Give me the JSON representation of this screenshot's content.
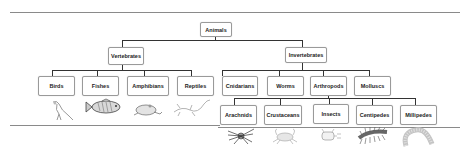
{
  "diagram": {
    "root": "Animals",
    "level1": {
      "vertebrates": "Vertebrates",
      "invertebrates": "Invertebrates"
    },
    "vertebrate_classes": [
      "Birds",
      "Fishes",
      "Amphibians",
      "Reptiles"
    ],
    "invertebrate_groups": [
      "Cnidarians",
      "Worms",
      "Arthropods",
      "Molluscs"
    ],
    "arthropod_classes": [
      "Arachnids",
      "Crustaceans",
      "Insects",
      "Centipedes",
      "Millipedes"
    ],
    "images": {
      "vertebrates": [
        "bird-icon",
        "fish-icon",
        "frog-icon",
        "lizard-icon"
      ],
      "arthropods": [
        "spider-icon",
        "crab-icon",
        "insect-icon",
        "centipede-icon",
        "millipede-icon"
      ]
    },
    "colors": {
      "connector": "#333333",
      "box_border": "#9a9a9a",
      "rule": "#8a8a8a"
    }
  }
}
